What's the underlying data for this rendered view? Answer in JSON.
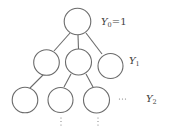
{
  "diagram": {
    "type": "tree",
    "stroke_color": "#6b6b6b",
    "levels": [
      {
        "label": "Y",
        "sub": "0",
        "suffix": "=1",
        "nodes": 1
      },
      {
        "label": "Y",
        "sub": "1",
        "suffix": "",
        "nodes": 3
      },
      {
        "label": "Y",
        "sub": "2",
        "suffix": "",
        "nodes": 3
      }
    ],
    "ellipsis_horizontal": "···",
    "ellipsis_vertical": "⋮"
  }
}
